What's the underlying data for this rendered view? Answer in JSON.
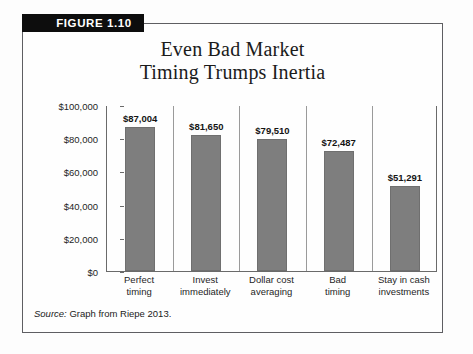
{
  "figure": {
    "tab_label": "FIGURE 1.10",
    "title_line1": "Even Bad Market",
    "title_line2": "Timing Trumps Inertia",
    "source_label": "Source:",
    "source_text": "Graph from Riepe 2013."
  },
  "colors": {
    "bar_fill": "#7e7e7e",
    "bar_stroke": "#6f6f6f",
    "axis": "#6a6a6a",
    "separator": "#9a9a9a",
    "frame": "#5e5e62",
    "tab_background": "#0d0d0d",
    "tab_text": "#ffffff"
  },
  "chart_data": {
    "type": "bar",
    "title": "Even Bad Market Timing Trumps Inertia",
    "xlabel": "",
    "ylabel": "Ending Wealth (1993–2012)",
    "ylim": [
      0,
      100000
    ],
    "yticks": [
      0,
      20000,
      40000,
      60000,
      80000,
      100000
    ],
    "ytick_labels": [
      "$0",
      "$20,000",
      "$40,000",
      "$60,000",
      "$80,000",
      "$100,000"
    ],
    "grid": false,
    "legend": false,
    "categories": [
      "Perfect timing",
      "Invest immediately",
      "Dollar cost averaging",
      "Bad timing",
      "Stay in cash investments"
    ],
    "category_lines": [
      [
        "Perfect",
        "timing"
      ],
      [
        "Invest",
        "immediately"
      ],
      [
        "Dollar cost",
        "averaging"
      ],
      [
        "Bad",
        "timing"
      ],
      [
        "Stay in cash",
        "investments"
      ]
    ],
    "values": [
      87004,
      81650,
      79510,
      72487,
      51291
    ],
    "data_labels": [
      "$87,004",
      "$81,650",
      "$79,510",
      "$72,487",
      "$51,291"
    ]
  }
}
